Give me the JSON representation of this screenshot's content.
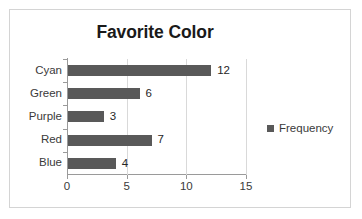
{
  "chart_data": {
    "type": "bar",
    "orientation": "horizontal",
    "title": "Favorite Color",
    "xlabel": "",
    "ylabel": "",
    "categories": [
      "Blue",
      "Red",
      "Purple",
      "Green",
      "Cyan"
    ],
    "values": [
      4,
      7,
      3,
      6,
      12
    ],
    "data_labels": [
      "4",
      "7",
      "3",
      "6",
      "12"
    ],
    "series": [
      {
        "name": "Frequency",
        "values": [
          4,
          7,
          3,
          6,
          12
        ],
        "color": "#595959"
      }
    ],
    "xlim": [
      0,
      15
    ],
    "xticks": [
      0,
      5,
      10,
      15
    ],
    "xtick_labels": [
      "0",
      "5",
      "10",
      "15"
    ],
    "grid": "vertical",
    "legend": {
      "position": "right",
      "entries": [
        "Frequency"
      ]
    }
  },
  "legend": {
    "label": "Frequency",
    "swatch_color": "#595959",
    "swatch_name": "legend-swatch-frequency"
  },
  "frame": {
    "border_color": "#d4d4d4",
    "background": "#ffffff"
  }
}
